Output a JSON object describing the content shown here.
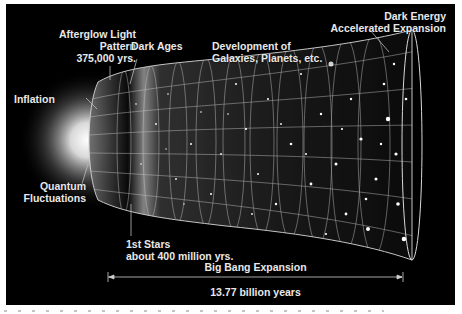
{
  "diagram": {
    "labels": {
      "afterglow": [
        "Afterglow Light",
        "Pattern",
        "375,000 yrs."
      ],
      "dark_ages": "Dark Ages",
      "development": [
        "Development of",
        "Galaxies, Planets, etc."
      ],
      "dark_energy": [
        "Dark Energy",
        "Accelerated Expansion"
      ],
      "inflation": "Inflation",
      "quantum": [
        "Quantum",
        "Fluctuations"
      ],
      "first_stars": [
        "1st Stars",
        "about 400 million yrs."
      ],
      "expansion": "Big Bang Expansion",
      "age": "13.77 billion years"
    },
    "colors": {
      "background": "#000000",
      "frame": "#ffffff",
      "text": "#e8e8e8",
      "grid": "#d0d0d0"
    }
  }
}
